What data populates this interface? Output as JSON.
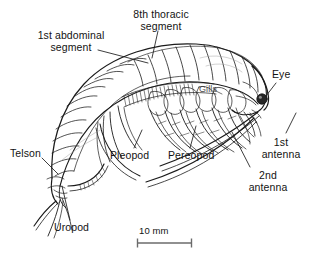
{
  "figure": {
    "background_color": "#ffffff",
    "ink_color": "#1a1a1a"
  },
  "labels": {
    "abdominal_segment": "1st abdominal\nsegment",
    "abdominal_segment_line1": "1st abdominal",
    "abdominal_segment_line2": "segment",
    "thoracic_segment_line1": "8th thoracic",
    "thoracic_segment_line2": "segment",
    "gills": "Gills",
    "eye": "Eye",
    "antenna1_line1": "1st",
    "antenna1_line2": "antenna",
    "antenna2_line1": "2nd",
    "antenna2_line2": "antenna",
    "pereopod": "Pereopod",
    "pleopod": "Pleopod",
    "telson": "Telson",
    "uropod": "Uropod"
  },
  "scale_bar": {
    "text": "10 mm",
    "value": 10,
    "unit": "mm",
    "length_px": 55
  }
}
